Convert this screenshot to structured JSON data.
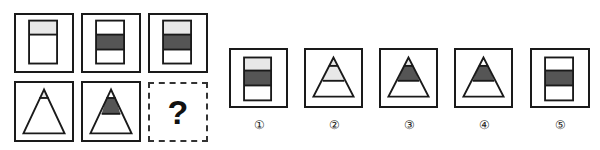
{
  "puzzle": {
    "question_mark": "?",
    "colors": {
      "light": "#e8e8e8",
      "dark": "#555555",
      "white": "#ffffff",
      "stroke": "#1a1a1a"
    },
    "grid": [
      {
        "id": "r1c1",
        "shape": "rectangle",
        "bands": [
          "light",
          "white",
          "white"
        ]
      },
      {
        "id": "r1c2",
        "shape": "rectangle",
        "bands": [
          "white",
          "dark",
          "white"
        ]
      },
      {
        "id": "r1c3",
        "shape": "rectangle",
        "bands": [
          "light",
          "dark",
          "white"
        ]
      },
      {
        "id": "r2c1",
        "shape": "triangle",
        "bands": [
          "light",
          "white",
          "white"
        ]
      },
      {
        "id": "r2c2",
        "shape": "triangle",
        "bands": [
          "white",
          "dark",
          "white"
        ]
      },
      {
        "id": "r2c3",
        "shape": "unknown"
      }
    ],
    "options": [
      {
        "label": "①",
        "shape": "rectangle",
        "bands": [
          "light",
          "dark",
          "white"
        ]
      },
      {
        "label": "②",
        "shape": "triangle",
        "bands": [
          "light",
          "light",
          "white"
        ]
      },
      {
        "label": "③",
        "shape": "triangle",
        "bands": [
          "light",
          "dark",
          "white"
        ]
      },
      {
        "label": "④",
        "shape": "triangle",
        "bands": [
          "white",
          "dark",
          "white"
        ]
      },
      {
        "label": "⑤",
        "shape": "rectangle",
        "bands": [
          "white",
          "dark",
          "white"
        ]
      }
    ]
  }
}
